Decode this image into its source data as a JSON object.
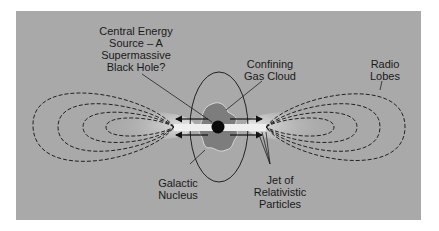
{
  "diagram": {
    "background_color": "#a9a9a9",
    "labels": {
      "energy_source": "Central Energy\nSource – A\nSupermassive\nBlack Hole?",
      "gas_cloud": "Confining\nGas Cloud",
      "radio_lobes": "Radio\nLobes",
      "galactic_nucleus": "Galactic\nNucleus",
      "jet": "Jet of\nRelativistic\nParticles"
    },
    "elements": {
      "black_hole": "black-hole",
      "gas_cloud": "gas-cloud",
      "nucleus_ellipse": "galactic-nucleus-ellipse",
      "jets": "relativistic-jets",
      "left_lobe_contours": 4,
      "right_lobe_contours": 4,
      "arrows": 4
    }
  }
}
